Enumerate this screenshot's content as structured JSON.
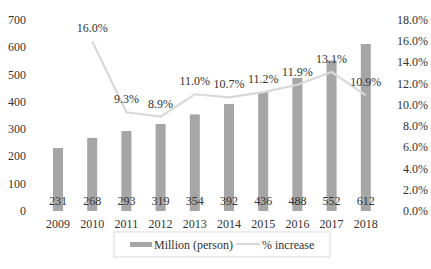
{
  "chart_data": {
    "type": "bar+line",
    "title": "",
    "categories": [
      "2009",
      "2010",
      "2011",
      "2012",
      "2013",
      "2014",
      "2015",
      "2016",
      "2017",
      "2018"
    ],
    "series": [
      {
        "name": "Million (person)",
        "type": "bar",
        "axis": "left",
        "color": "#a6a6a6",
        "values": [
          231,
          268,
          293,
          319,
          354,
          392,
          436,
          488,
          552,
          612
        ]
      },
      {
        "name": "% increase",
        "type": "line",
        "axis": "right",
        "color": "#d9d9d9",
        "values": [
          null,
          16.0,
          9.3,
          8.9,
          11.0,
          10.7,
          11.2,
          11.9,
          13.1,
          10.9
        ],
        "labels": [
          "",
          "16.0%",
          "9.3%",
          "8.9%",
          "11.0%",
          "10.7%",
          "11.2%",
          "11.9%",
          "13.1%",
          "10.9%"
        ]
      }
    ],
    "left_axis": {
      "min": 0,
      "max": 700,
      "ticks": [
        "0",
        "100",
        "200",
        "300",
        "400",
        "500",
        "600",
        "700"
      ]
    },
    "right_axis": {
      "min": 0,
      "max": 18,
      "ticks": [
        "0.0%",
        "2.0%",
        "4.0%",
        "6.0%",
        "8.0%",
        "10.0%",
        "12.0%",
        "14.0%",
        "16.0%",
        "18.0%"
      ]
    },
    "xlabel": "",
    "ylabel": "",
    "y2label": "",
    "grid": false,
    "legend": {
      "position": "bottom",
      "items": [
        "Million (person)",
        "% increase"
      ]
    }
  }
}
